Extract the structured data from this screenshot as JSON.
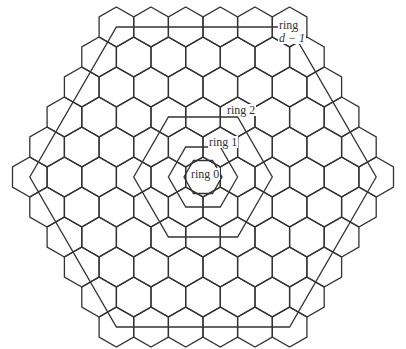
{
  "diagram": {
    "type": "hexagonal-cell-grid",
    "grid_radius": 5,
    "center": [
      203,
      177
    ],
    "hex_side": 20,
    "stroke_color": "#333333",
    "rings_drawn": [
      0,
      1,
      2,
      5
    ]
  },
  "labels": {
    "ring0": "ring 0",
    "ring1": "ring 1",
    "ring2": "ring 2",
    "ringd_line1": "ring",
    "ringd_line2": "d − 1"
  }
}
